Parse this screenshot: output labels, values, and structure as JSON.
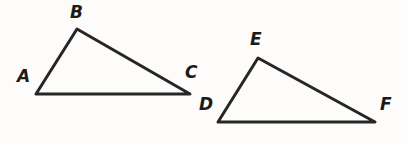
{
  "figure": {
    "background_color": "#fdfcfa",
    "stroke_color": "#262626",
    "stroke_width": 3,
    "label_color": "#1b1b1b",
    "shapes": [
      {
        "name": "triangle-abc",
        "type": "triangle",
        "points": "36,94 77,29 190,94",
        "vertices": [
          {
            "label": "A",
            "x": 36,
            "y": 94
          },
          {
            "label": "B",
            "x": 77,
            "y": 29
          },
          {
            "label": "C",
            "x": 190,
            "y": 94
          }
        ]
      },
      {
        "name": "triangle-def",
        "type": "triangle",
        "points": "218,122 258,58 375,122",
        "vertices": [
          {
            "label": "D",
            "x": 218,
            "y": 122
          },
          {
            "label": "E",
            "x": 258,
            "y": 58
          },
          {
            "label": "F",
            "x": 375,
            "y": 122
          }
        ]
      }
    ]
  },
  "labels": {
    "a": "A",
    "b": "B",
    "c": "C",
    "d": "D",
    "e": "E",
    "f": "F"
  }
}
